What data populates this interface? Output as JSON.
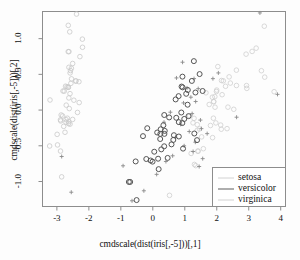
{
  "chart_data": {
    "type": "scatter",
    "title": "",
    "xlabel": "cmdscale(dist(iris[,-5]))[,1]",
    "ylabel": "cmdscale(dist(iris[,-5]))[,2]",
    "xlim": [
      -3.45,
      4.15
    ],
    "ylim": [
      -1.35,
      1.38
    ],
    "xticks": [
      "-3",
      "-2",
      "-1",
      "0",
      "1",
      "2",
      "3",
      "4"
    ],
    "xtick_values": [
      -3,
      -2,
      -1,
      0,
      1,
      2,
      3,
      4
    ],
    "yticks": [
      "-1.0",
      "-0.5",
      "0.0",
      "0.5",
      "1.0"
    ],
    "ytick_values": [
      -1.0,
      -0.5,
      0.0,
      0.5,
      1.0
    ],
    "grid": false,
    "box": true,
    "legend_position": "bottom-right",
    "series": [
      {
        "name": "setosa",
        "color": "#c9c9c9",
        "marker": "circle",
        "points": [
          [
            -2.684,
            0.327
          ],
          [
            -2.715,
            -0.17
          ],
          [
            -2.889,
            -0.137
          ],
          [
            -2.746,
            -0.311
          ],
          [
            -2.729,
            0.334
          ],
          [
            -2.28,
            0.748
          ],
          [
            -2.821,
            -0.082
          ],
          [
            -2.626,
            0.17
          ],
          [
            -2.887,
            -0.574
          ],
          [
            -2.673,
            -0.114
          ],
          [
            -2.507,
            0.652
          ],
          [
            -2.613,
            0.021
          ],
          [
            -2.787,
            -0.228
          ],
          [
            -3.226,
            -0.503
          ],
          [
            -2.644,
            1.186
          ],
          [
            -2.386,
            1.344
          ],
          [
            -2.623,
            0.818
          ],
          [
            -2.648,
            0.319
          ],
          [
            -2.199,
            0.879
          ],
          [
            -2.587,
            0.52
          ],
          [
            -2.311,
            0.397
          ],
          [
            -2.543,
            0.437
          ],
          [
            -3.215,
            0.141
          ],
          [
            -2.303,
            0.105
          ],
          [
            -2.356,
            -0.033
          ],
          [
            -2.507,
            -0.131
          ],
          [
            -2.469,
            0.138
          ],
          [
            -2.562,
            0.374
          ],
          [
            -2.639,
            0.319
          ],
          [
            -2.633,
            -0.19
          ],
          [
            -2.589,
            -0.197
          ],
          [
            -2.41,
            0.409
          ],
          [
            -2.645,
            0.818
          ],
          [
            -2.598,
            1.095
          ],
          [
            -2.63,
            -0.163
          ],
          [
            -2.866,
            -0.069
          ],
          [
            -2.624,
            0.599
          ],
          [
            -2.809,
            0.267
          ],
          [
            -2.98,
            -0.488
          ],
          [
            -2.59,
            0.23
          ],
          [
            -2.77,
            0.265
          ],
          [
            -2.851,
            -0.935
          ],
          [
            -2.992,
            -0.34
          ],
          [
            -2.405,
            0.405
          ],
          [
            -2.203,
            0.993
          ],
          [
            -2.712,
            -0.134
          ],
          [
            -2.547,
            0.586
          ],
          [
            -2.88,
            -0.152
          ],
          [
            -2.574,
            0.553
          ],
          [
            -2.708,
            0.069
          ]
        ]
      },
      {
        "name": "versicolor",
        "color": "#555555",
        "marker": "circle",
        "points": [
          [
            1.284,
            0.685
          ],
          [
            0.932,
            0.318
          ],
          [
            1.464,
            0.504
          ],
          [
            0.183,
            -0.827
          ],
          [
            1.088,
            0.075
          ],
          [
            0.641,
            -0.418
          ],
          [
            1.095,
            0.281
          ],
          [
            -0.749,
            -1.006
          ],
          [
            1.044,
            0.228
          ],
          [
            -0.008,
            -0.722
          ],
          [
            -0.507,
            -1.26
          ],
          [
            0.511,
            -0.103
          ],
          [
            0.265,
            -0.55
          ],
          [
            0.984,
            -0.124
          ],
          [
            -0.174,
            -0.254
          ],
          [
            0.927,
            0.468
          ],
          [
            0.66,
            -0.352
          ],
          [
            0.236,
            -0.333
          ],
          [
            0.946,
            -0.54
          ],
          [
            0.045,
            -0.583
          ],
          [
            1.118,
            -0.085
          ],
          [
            0.358,
            -0.069
          ],
          [
            1.299,
            -0.328
          ],
          [
            0.923,
            -0.182
          ],
          [
            0.714,
            0.149
          ],
          [
            0.9,
            0.329
          ],
          [
            1.333,
            0.246
          ],
          [
            1.558,
            0.267
          ],
          [
            0.813,
            -0.169
          ],
          [
            -0.307,
            -0.365
          ],
          [
            -0.069,
            -0.706
          ],
          [
            -0.204,
            -0.685
          ],
          [
            0.137,
            -0.314
          ],
          [
            1.383,
            -0.421
          ],
          [
            0.585,
            -0.48
          ],
          [
            0.807,
            0.195
          ],
          [
            1.221,
            0.408
          ],
          [
            0.814,
            -0.37
          ],
          [
            0.246,
            -0.269
          ],
          [
            0.166,
            -0.681
          ],
          [
            0.464,
            -0.67
          ],
          [
            0.891,
            -0.034
          ],
          [
            0.231,
            -0.405
          ],
          [
            -0.708,
            -1.006
          ],
          [
            0.356,
            -0.507
          ],
          [
            0.331,
            -0.212
          ],
          [
            0.374,
            -0.291
          ],
          [
            0.733,
            -0.108
          ],
          [
            -0.536,
            -0.719
          ],
          [
            0.363,
            -0.333
          ]
        ]
      },
      {
        "name": "virginica",
        "color": "#cfcfcf",
        "marker": "circle",
        "points": [
          [
            2.532,
            0.011
          ],
          [
            1.413,
            -0.575
          ],
          [
            2.616,
            0.344
          ],
          [
            1.972,
            -0.18
          ],
          [
            2.35,
            0.041
          ],
          [
            3.397,
            0.551
          ],
          [
            0.522,
            -1.194
          ],
          [
            2.931,
            0.343
          ],
          [
            2.322,
            -0.26
          ],
          [
            2.917,
            0.783
          ],
          [
            1.662,
            0.242
          ],
          [
            1.803,
            -0.216
          ],
          [
            2.167,
            0.215
          ],
          [
            1.343,
            -0.778
          ],
          [
            1.581,
            -0.541
          ],
          [
            1.907,
            0.118
          ],
          [
            1.946,
            0.04
          ],
          [
            3.487,
            1.174
          ],
          [
            3.795,
            0.257
          ],
          [
            1.301,
            -0.761
          ],
          [
            2.425,
            0.378
          ],
          [
            1.199,
            -0.607
          ],
          [
            3.5,
            0.461
          ],
          [
            1.389,
            -0.204
          ],
          [
            2.275,
            0.333
          ],
          [
            2.614,
            0.559
          ],
          [
            1.258,
            -0.179
          ],
          [
            1.29,
            -0.116
          ],
          [
            2.123,
            -0.21
          ],
          [
            2.387,
            0.465
          ],
          [
            2.94,
            0.304
          ],
          [
            3.232,
            0.867
          ],
          [
            2.141,
            -0.268
          ],
          [
            1.458,
            -0.264
          ],
          [
            1.869,
            -0.386
          ],
          [
            3.106,
            0.821
          ],
          [
            1.999,
            0.28
          ],
          [
            1.895,
            -0.114
          ],
          [
            1.152,
            -0.082
          ],
          [
            2.034,
            0.609
          ],
          [
            1.991,
            0.26
          ],
          [
            1.862,
            0.18
          ],
          [
            1.413,
            -0.575
          ],
          [
            2.205,
            0.409
          ],
          [
            2.148,
            0.414
          ],
          [
            1.94,
            0.188
          ],
          [
            1.527,
            -0.375
          ],
          [
            1.764,
            0.078
          ],
          [
            1.901,
            0.117
          ],
          [
            1.39,
            -0.283
          ]
        ]
      }
    ],
    "cross_markers": {
      "name": "overlay-crosses",
      "color": "#8a8a8a",
      "marker": "plus",
      "points": [
        [
          0.93,
          0.67
        ],
        [
          1.29,
          0.44
        ],
        [
          0.74,
          0.45
        ],
        [
          1.42,
          0.3
        ],
        [
          1.07,
          0.31
        ],
        [
          1.19,
          0.18
        ],
        [
          0.96,
          0.1
        ],
        [
          1.34,
          0.12
        ],
        [
          0.55,
          -0.03
        ],
        [
          1.23,
          -0.05
        ],
        [
          1.49,
          -0.14
        ],
        [
          0.87,
          -0.2
        ],
        [
          1.14,
          -0.3
        ],
        [
          1.52,
          -0.26
        ],
        [
          0.71,
          -0.38
        ],
        [
          1.33,
          -0.45
        ],
        [
          0.98,
          -0.5
        ],
        [
          1.26,
          -0.58
        ],
        [
          1.56,
          -0.68
        ],
        [
          0.62,
          -0.64
        ],
        [
          0.41,
          -0.72
        ],
        [
          1.45,
          -0.79
        ],
        [
          -0.93,
          -0.78
        ],
        [
          -0.65,
          -1.27
        ],
        [
          -0.28,
          -1.13
        ],
        [
          0.12,
          -0.9
        ],
        [
          -2.55,
          -1.15
        ],
        [
          -2.85,
          -0.65
        ],
        [
          1.7,
          -0.33
        ],
        [
          1.88,
          0.44
        ],
        [
          2.05,
          0.52
        ],
        [
          2.62,
          -0.1
        ],
        [
          3.35,
          1.36
        ],
        [
          3.9,
          0.22
        ],
        [
          0.35,
          -0.17
        ]
      ]
    },
    "legend_entries": [
      {
        "label": "setosa",
        "color": "#d2d2d2"
      },
      {
        "label": "versicolor",
        "color": "#9a9a9a"
      },
      {
        "label": "virginica",
        "color": "#d2d2d2"
      }
    ]
  },
  "figure": {
    "background": "#fdfdfd",
    "box_color": "#8d8d8d",
    "tick_color": "#8d8d8d",
    "text_color": "#111111"
  }
}
